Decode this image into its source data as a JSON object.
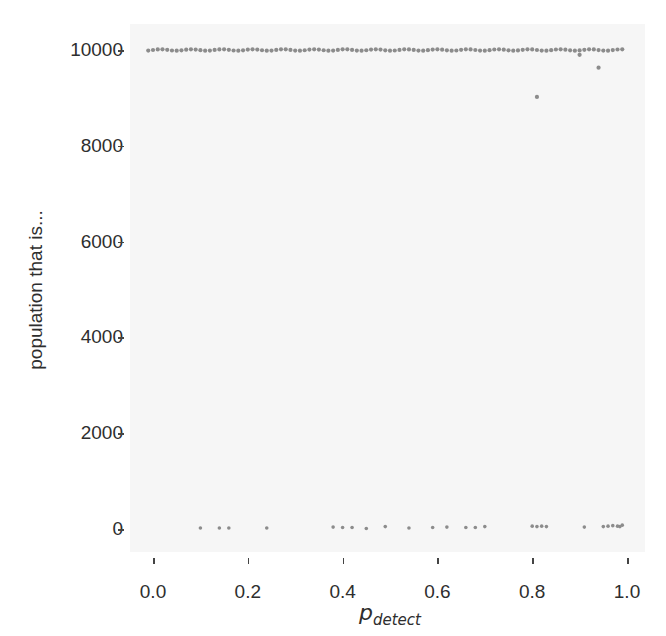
{
  "chart_data": {
    "type": "scatter",
    "title": "",
    "xlabel_main": "p",
    "xlabel_sub": "detect",
    "ylabel": "population that is...",
    "xlim": [
      -0.05,
      1.04
    ],
    "ylim": [
      -500,
      10500
    ],
    "xticks": [
      0.0,
      0.2,
      0.4,
      0.6,
      0.8,
      1.0
    ],
    "xtick_labels": [
      "0.0",
      "0.2",
      "0.4",
      "0.6",
      "0.8",
      "1.0"
    ],
    "yticks": [
      0,
      2000,
      4000,
      6000,
      8000,
      10000
    ],
    "ytick_labels": [
      "0",
      "2000",
      "4000",
      "6000",
      "8000",
      "10000"
    ],
    "grid": false,
    "marker_color": "#8c8c8c",
    "series": [
      {
        "name": "upper",
        "description": "dense row of points at ~10000 for p from -0.01 to 0.99 (step ~0.01)",
        "x_start": -0.01,
        "x_end": 0.99,
        "x_step": 0.01,
        "y": 10000,
        "outliers": [
          {
            "x": 0.81,
            "y": 9020
          },
          {
            "x": 0.9,
            "y": 9900
          },
          {
            "x": 0.94,
            "y": 9630
          }
        ]
      },
      {
        "name": "lower",
        "points": [
          {
            "x": 0.1,
            "y": 20
          },
          {
            "x": 0.14,
            "y": 20
          },
          {
            "x": 0.16,
            "y": 20
          },
          {
            "x": 0.24,
            "y": 20
          },
          {
            "x": 0.38,
            "y": 40
          },
          {
            "x": 0.4,
            "y": 30
          },
          {
            "x": 0.42,
            "y": 30
          },
          {
            "x": 0.45,
            "y": 10
          },
          {
            "x": 0.49,
            "y": 50
          },
          {
            "x": 0.54,
            "y": 20
          },
          {
            "x": 0.59,
            "y": 30
          },
          {
            "x": 0.62,
            "y": 40
          },
          {
            "x": 0.66,
            "y": 30
          },
          {
            "x": 0.68,
            "y": 30
          },
          {
            "x": 0.7,
            "y": 50
          },
          {
            "x": 0.8,
            "y": 60
          },
          {
            "x": 0.81,
            "y": 50
          },
          {
            "x": 0.82,
            "y": 60
          },
          {
            "x": 0.83,
            "y": 50
          },
          {
            "x": 0.91,
            "y": 40
          },
          {
            "x": 0.95,
            "y": 50
          },
          {
            "x": 0.96,
            "y": 60
          },
          {
            "x": 0.97,
            "y": 70
          },
          {
            "x": 0.98,
            "y": 60
          },
          {
            "x": 0.99,
            "y": 80
          },
          {
            "x": 0.985,
            "y": 50
          }
        ]
      }
    ]
  }
}
